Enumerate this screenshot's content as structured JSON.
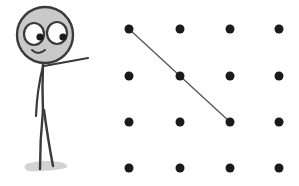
{
  "figure": {
    "character": {
      "head": {
        "cx": 45,
        "cy": 35,
        "r": 28,
        "fill": "#c9c9c9",
        "stroke": "#3a3a3a"
      },
      "eyes": [
        {
          "cx": 34,
          "cy": 34,
          "rx": 10,
          "ry": 11,
          "pupil": {
            "cx": 40,
            "cy": 38,
            "r": 3.5
          }
        },
        {
          "cx": 56,
          "cy": 33,
          "rx": 10,
          "ry": 11,
          "pupil": {
            "cx": 62,
            "cy": 38,
            "r": 3.5
          }
        }
      ],
      "colors": {
        "line": "#3a3a3a",
        "shadow": "#bdbdbd"
      }
    },
    "grid": {
      "columns": [
        129,
        180,
        230,
        279
      ],
      "rows": [
        29,
        76,
        122,
        168
      ],
      "dot_radius": 4.5,
      "dot_color": "#1a1a1a"
    },
    "connecting_line": {
      "points": [
        [
          129,
          29
        ],
        [
          180,
          76
        ],
        [
          230,
          122
        ]
      ],
      "color": "#555555",
      "width": 1.3
    }
  }
}
